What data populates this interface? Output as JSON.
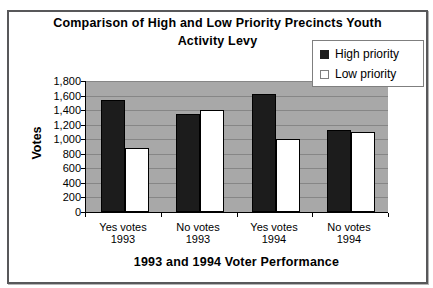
{
  "chart_data": {
    "type": "bar",
    "title": "Comparison of High and Low Priority Precincts Youth Activity Levy",
    "title_lines": [
      "Comparison of High and Low Priority Precincts Youth",
      "Activity Levy"
    ],
    "ylabel": "Votes",
    "xlabel": "1993 and 1994 Voter Performance",
    "categories": [
      "Yes votes 1993",
      "No votes 1993",
      "Yes votes 1994",
      "No votes 1994"
    ],
    "category_lines": [
      [
        "Yes votes",
        "1993"
      ],
      [
        "No votes",
        "1993"
      ],
      [
        "Yes votes",
        "1994"
      ],
      [
        "No votes",
        "1994"
      ]
    ],
    "series": [
      {
        "name": "High priority",
        "color": "#1c1c1c",
        "values": [
          1540,
          1340,
          1620,
          1120
        ]
      },
      {
        "name": "Low priority",
        "color": "#ffffff",
        "values": [
          880,
          1400,
          1000,
          1100
        ]
      }
    ],
    "ylim": [
      0,
      1800
    ],
    "ytick_step": 200,
    "ytick_labels": [
      "0",
      "200",
      "400",
      "600",
      "800",
      "1,000",
      "1,200",
      "1,400",
      "1,600",
      "1,800"
    ],
    "grid": true,
    "legend_position": "top-right",
    "plot_background": "#a8a8a8",
    "gridline_color": "#868686",
    "bar_border_color": "#000000"
  },
  "frame": {
    "border_color": "#58585a",
    "background": "#ffffff"
  },
  "legend": {
    "border_color": "#7f7f7f",
    "background": "#ffffff"
  }
}
